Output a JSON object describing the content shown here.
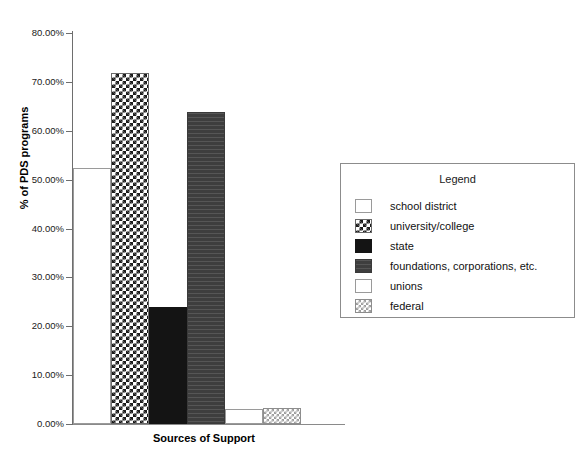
{
  "chart_data": {
    "type": "bar",
    "title": "",
    "xlabel": "Sources of Support",
    "ylabel": "% of PDS programs",
    "categories": [
      "school district",
      "university/college",
      "state",
      "foundations, corporations, etc.",
      "unions",
      "federal"
    ],
    "values": [
      52.4,
      71.8,
      23.9,
      63.8,
      3.0,
      3.3
    ],
    "value_labels": [
      "52.40%",
      "71.80%",
      "23.90%",
      "63.80%",
      "3.00%",
      "3.30%"
    ],
    "ylim": [
      0,
      80
    ],
    "ytick_values": [
      0,
      10,
      20,
      30,
      40,
      50,
      60,
      70,
      80
    ],
    "ytick_labels": [
      "0.00%",
      "10.00%",
      "20.00%",
      "30.00%",
      "40.00%",
      "50.00%",
      "60.00%",
      "70.00%",
      "80.00%"
    ],
    "xtick_labels": [],
    "grid": false,
    "legend_position": "right",
    "series": [
      {
        "name": "% of PDS programs",
        "values": [
          52.4,
          71.8,
          23.9,
          63.8,
          3.0,
          3.3
        ]
      }
    ]
  },
  "legend": {
    "title": "Legend",
    "items": [
      {
        "label": "school district",
        "pattern": "empty",
        "color": "#ffffff"
      },
      {
        "label": "university/college",
        "pattern": "checker-dark",
        "color": "#1b1b1b"
      },
      {
        "label": "state",
        "pattern": "solid-black",
        "color": "#141414"
      },
      {
        "label": "foundations, corporations, etc.",
        "pattern": "dark-lines",
        "color": "#454545"
      },
      {
        "label": "unions",
        "pattern": "empty",
        "color": "#ffffff"
      },
      {
        "label": "federal",
        "pattern": "checker-light",
        "color": "#9e9e9e"
      }
    ]
  },
  "axes": {
    "y_title": "% of PDS programs",
    "x_title": "Sources of Support"
  }
}
